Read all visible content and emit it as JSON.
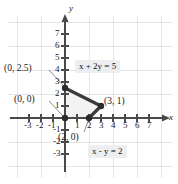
{
  "figure": {
    "type": "math-graph",
    "axis_labels": {
      "x": "x",
      "y": "y"
    },
    "x_ticks": [
      "-3",
      "-2",
      "-1",
      "1",
      "2",
      "3",
      "4",
      "5",
      "6",
      "7"
    ],
    "y_ticks": [
      "7",
      "6",
      "5",
      "4",
      "3",
      "2",
      "1",
      "-1",
      "-2",
      "-3"
    ],
    "x_range": [
      -3.6,
      7.9
    ],
    "y_range": [
      -3.6,
      7.9
    ],
    "grid": "light-gray, every 2 units",
    "colors": {
      "line": "#3b3b3b",
      "grid": "#e2e3e6",
      "axis": "#4a4a4a",
      "label_box": "#eceef0",
      "region_fill": "#f2f2f2",
      "text": "#1a1a1a"
    },
    "equations": [
      {
        "name": "line-1",
        "text": "x + 2y = 5"
      },
      {
        "name": "line-2",
        "text": "x - y = 2"
      }
    ],
    "points": [
      {
        "name": "point-0-2.5",
        "label": "(0, 2.5)",
        "x": 0,
        "y": 2.5
      },
      {
        "name": "point-0-0",
        "label": "(0, 0)",
        "x": 0,
        "y": 0
      },
      {
        "name": "point-3-1",
        "label": "(3, 1)",
        "x": 3,
        "y": 1
      },
      {
        "name": "point-2-0",
        "label": "(2, 0)",
        "x": 2,
        "y": 0
      }
    ],
    "segments": [
      {
        "from": [
          0,
          2.5
        ],
        "to": [
          3,
          1
        ]
      },
      {
        "from": [
          3,
          1
        ],
        "to": [
          2,
          0
        ]
      }
    ]
  }
}
